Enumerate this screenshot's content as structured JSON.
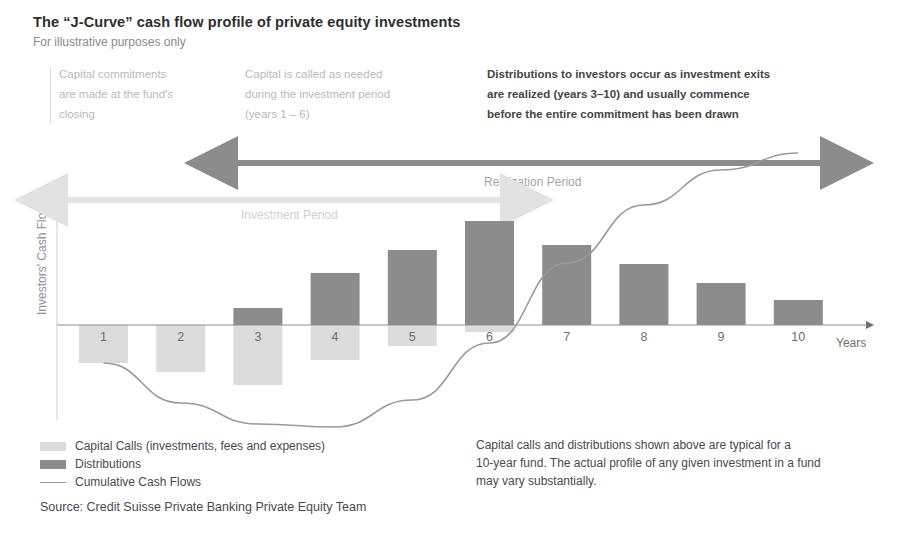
{
  "header": {
    "title": "The “J-Curve” cash flow profile of private equity investments",
    "subtitle": "For illustrative purposes only"
  },
  "annotations": [
    {
      "id": "annot-1",
      "style": "light",
      "lines": [
        "Capital commitments",
        "are made at the fund's",
        "closing"
      ]
    },
    {
      "id": "annot-2",
      "style": "light",
      "lines": [
        "Capital is called as needed",
        "during the investment period",
        "(years 1 – 6)"
      ]
    },
    {
      "id": "annot-3",
      "style": "dark",
      "lines": [
        "Distributions to investors occur as investment exits",
        "are realized (years 3–10) and usually commence",
        "before the entire commitment has been drawn"
      ]
    }
  ],
  "periods": {
    "realization": "Realization Period",
    "investment": "Investment Period"
  },
  "legend": [
    {
      "type": "swatch",
      "color": "#dcdcdc",
      "label": "Capital Calls (investments, fees and expenses)"
    },
    {
      "type": "swatch",
      "color": "#8c8c8c",
      "label": "Distributions"
    },
    {
      "type": "line",
      "color": "#9a9a9a",
      "label": "Cumulative Cash Flows"
    }
  ],
  "footnote": {
    "lines": [
      "Capital calls and distributions shown above are typical for a",
      "10-year fund. The actual profile of any given investment in a fund",
      "may vary substantially."
    ]
  },
  "source": "Source: Credit Suisse Private Banking Private Equity Team",
  "colors": {
    "capital_calls": "#dcdcdc",
    "distributions": "#8c8c8c",
    "curve": "#9a9a9a",
    "axis": "#8f8f8f",
    "arrow_dark": "#8c8c8c",
    "arrow_light": "#e2e2e2"
  },
  "chart_data": {
    "type": "bar",
    "title": "The “J-Curve” cash flow profile of private equity investments",
    "subtitle": "For illustrative purposes only",
    "xlabel": "Years",
    "ylabel": "Investors' Cash Flows",
    "grid": false,
    "legend_position": "bottom-left",
    "categories": [
      "1",
      "2",
      "3",
      "4",
      "5",
      "6",
      "7",
      "8",
      "9",
      "10"
    ],
    "series": [
      {
        "name": "Capital Calls (investments, fees and expenses)",
        "color": "#dcdcdc",
        "values": [
          -38,
          -47,
          -60,
          -35,
          -21,
          -7,
          0,
          0,
          0,
          0
        ]
      },
      {
        "name": "Distributions",
        "color": "#8c8c8c",
        "values": [
          0,
          0,
          17,
          52,
          75,
          104,
          80,
          61,
          42,
          25
        ]
      }
    ],
    "curve": {
      "name": "Cumulative Cash Flows",
      "color": "#9a9a9a",
      "x": [
        1,
        2,
        3,
        4,
        5,
        6,
        7,
        8,
        9,
        10
      ],
      "values": [
        -38,
        -78,
        -99,
        -102,
        -75,
        -18,
        62,
        120,
        155,
        172
      ]
    },
    "ylim": [
      -115,
      195
    ],
    "annotations": [
      {
        "label": "Investment Period",
        "from_year": 0.4,
        "to_year": 6.2
      },
      {
        "label": "Realization Period",
        "from_year": 2.9,
        "to_year": 10.9
      }
    ]
  }
}
